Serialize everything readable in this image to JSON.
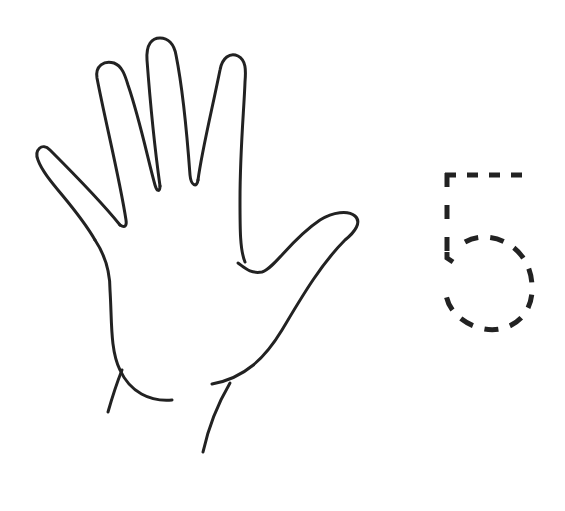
{
  "worksheet": {
    "subject": "counting",
    "hand": {
      "fingers_shown": 5,
      "stroke_color": "#222222"
    },
    "tracing_digit": {
      "value": "5",
      "style": "dashed",
      "stroke_color": "#222222"
    }
  },
  "colors": {
    "background": "#ffffff",
    "ink": "#222222"
  }
}
